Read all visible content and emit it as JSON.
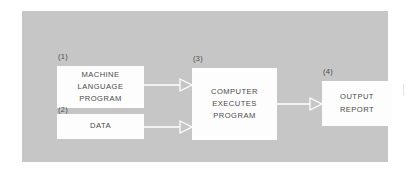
{
  "diagram": {
    "panel_color": "#c6c6c6",
    "box_color": "#fdfdfd",
    "text_color": "#4a4a4a",
    "arrow_color": "#ffffff",
    "nodes": [
      {
        "id": "machine-language-program",
        "step": "(1)",
        "lines": [
          "MACHINE",
          "LANGUAGE",
          "PROGRAM"
        ]
      },
      {
        "id": "data",
        "step": "(2)",
        "lines": [
          "DATA"
        ]
      },
      {
        "id": "computer-executes-program",
        "step": "(3)",
        "lines": [
          "COMPUTER",
          "EXECUTES",
          "PROGRAM"
        ]
      },
      {
        "id": "output-report",
        "step": "(4)",
        "lines": [
          "OUTPUT",
          "REPORT"
        ]
      }
    ],
    "connectors": [
      {
        "id": "machine-to-computer",
        "from": "(1)",
        "to": "(3)"
      },
      {
        "id": "data-to-computer",
        "from": "(2)",
        "to": "(3)"
      },
      {
        "id": "computer-to-output",
        "from": "(3)",
        "to": "(4)"
      }
    ]
  }
}
